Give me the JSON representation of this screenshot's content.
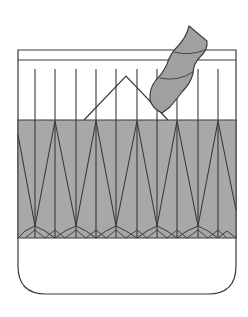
{
  "emblem": {
    "type": "heraldic-shield",
    "colors": {
      "field": "#ffffff",
      "band": "#a8a8a8",
      "stroke": "#3a3a3a",
      "twist": "#a0a0a0"
    },
    "charges": [
      "chief-band",
      "vertical-lines",
      "mountain",
      "twisted-rope",
      "zigzag-fess",
      "chevron-base-row"
    ]
  }
}
